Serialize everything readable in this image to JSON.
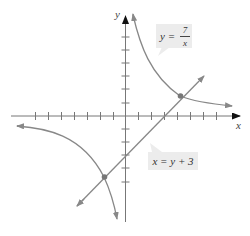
{
  "figure": {
    "type": "coordinate-graph",
    "axes": {
      "x_label": "x",
      "y_label": "y",
      "x_ticks": [
        -7,
        -6,
        -5,
        -4,
        -3,
        -2,
        -1,
        1,
        2,
        3,
        4,
        5,
        6,
        7
      ],
      "y_ticks": [
        -5,
        -4,
        -3,
        -2,
        -1,
        1,
        2,
        3,
        4,
        5,
        6
      ]
    },
    "curves": [
      {
        "name": "hyperbola",
        "label_lhs": "y =",
        "label_num": "7",
        "label_den": "x"
      },
      {
        "name": "line",
        "label": "x = y + 3"
      }
    ],
    "intersections": [
      [
        4.54,
        1.54
      ],
      [
        -1.54,
        -4.54
      ]
    ],
    "colors": {
      "curve": "#8a8a8a",
      "axis": "#6a6a6a",
      "point": "#777777",
      "label_bg": "#ececec"
    }
  }
}
